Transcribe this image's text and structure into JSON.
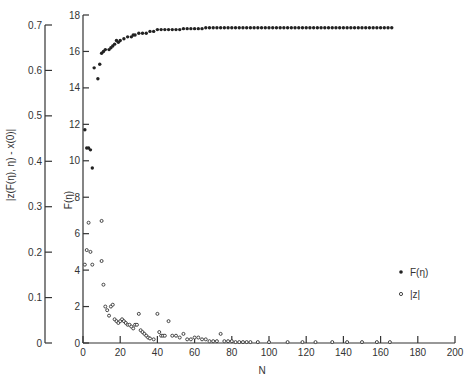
{
  "chart_data": {
    "type": "scatter",
    "title": "",
    "xlabel": "N",
    "ylabel": "F(η)",
    "ylabel_secondary": "|z(F(η), η) - x(0)|",
    "xlim": [
      0,
      200
    ],
    "ylim": [
      0,
      18
    ],
    "ylim_secondary": [
      0,
      0.7
    ],
    "grid": false,
    "legend_position": "right-middle",
    "x_ticks": [
      0,
      20,
      40,
      60,
      80,
      100,
      120,
      140,
      160,
      180,
      200
    ],
    "y_ticks": [
      0,
      2,
      4,
      6,
      8,
      10,
      12,
      14,
      16,
      18
    ],
    "y_ticks_secondary": [
      "0",
      "0.1",
      "0.2",
      "0.3",
      "0.4",
      "0.5",
      "0.6",
      "0.7"
    ],
    "legend": [
      {
        "label": "F(η)",
        "marker": "filled-dot"
      },
      {
        "label": "|z|",
        "marker": "open-circle"
      }
    ],
    "series": [
      {
        "name": "F(η)",
        "marker": "filled-dot",
        "axis": "primary",
        "x": [
          1,
          2,
          3,
          4,
          5,
          6,
          8,
          9,
          10,
          11,
          12,
          14,
          15,
          16,
          17,
          18,
          19,
          20,
          22,
          24,
          26,
          27,
          28,
          30,
          32,
          34,
          36,
          38,
          40,
          42,
          44,
          46,
          48,
          50,
          52,
          54,
          56,
          58,
          60,
          62,
          64,
          66,
          68,
          70,
          72,
          74,
          76,
          78,
          80,
          82,
          84,
          86,
          88,
          90,
          92,
          94,
          96,
          98,
          100,
          102,
          104,
          106,
          108,
          110,
          112,
          114,
          116,
          118,
          120,
          122,
          124,
          126,
          128,
          130,
          132,
          134,
          136,
          138,
          140,
          142,
          144,
          146,
          148,
          150,
          152,
          154,
          156,
          158,
          160,
          162,
          164,
          166
        ],
        "y": [
          11.7,
          10.7,
          10.7,
          10.6,
          9.6,
          15.1,
          14.5,
          15.3,
          15.9,
          16.0,
          16.1,
          16.1,
          16.2,
          16.3,
          16.4,
          16.6,
          16.5,
          16.6,
          16.7,
          16.8,
          16.8,
          16.9,
          16.9,
          17.0,
          17.0,
          17.0,
          17.1,
          17.1,
          17.2,
          17.2,
          17.2,
          17.2,
          17.2,
          17.2,
          17.2,
          17.25,
          17.25,
          17.25,
          17.25,
          17.25,
          17.25,
          17.3,
          17.3,
          17.3,
          17.3,
          17.3,
          17.3,
          17.3,
          17.3,
          17.3,
          17.3,
          17.3,
          17.3,
          17.3,
          17.3,
          17.3,
          17.3,
          17.3,
          17.3,
          17.3,
          17.3,
          17.3,
          17.3,
          17.3,
          17.3,
          17.3,
          17.3,
          17.3,
          17.3,
          17.3,
          17.3,
          17.3,
          17.3,
          17.3,
          17.3,
          17.3,
          17.3,
          17.3,
          17.3,
          17.3,
          17.3,
          17.3,
          17.3,
          17.3,
          17.3,
          17.3,
          17.3,
          17.3,
          17.3,
          17.3,
          17.3,
          17.3
        ]
      },
      {
        "name": "|z|",
        "marker": "open-circle",
        "axis": "primary_scale_shared",
        "x": [
          1,
          2,
          3,
          4,
          5,
          10,
          10,
          11,
          12,
          13,
          14,
          15,
          16,
          17,
          18,
          19,
          20,
          21,
          22,
          23,
          24,
          25,
          26,
          27,
          28,
          29,
          30,
          31,
          32,
          33,
          34,
          35,
          36,
          38,
          40,
          41,
          42,
          43,
          44,
          46,
          48,
          50,
          52,
          54,
          56,
          58,
          60,
          62,
          64,
          66,
          68,
          70,
          72,
          74,
          76,
          78,
          80,
          82,
          84,
          86,
          88,
          90,
          94,
          100,
          110,
          118,
          125,
          134,
          142,
          150,
          158,
          165
        ],
        "y": [
          4.3,
          5.1,
          6.6,
          5.0,
          4.3,
          6.7,
          4.5,
          3.2,
          2.0,
          1.8,
          1.5,
          2.0,
          2.1,
          1.3,
          1.2,
          1.1,
          1.2,
          1.3,
          1.2,
          1.1,
          1.0,
          1.0,
          0.9,
          0.8,
          1.0,
          1.0,
          1.6,
          0.7,
          0.6,
          0.5,
          0.4,
          0.3,
          0.25,
          0.2,
          1.6,
          0.6,
          0.4,
          0.4,
          0.4,
          1.2,
          0.4,
          0.4,
          0.3,
          0.5,
          0.2,
          0.2,
          0.3,
          0.3,
          0.2,
          0.2,
          0.1,
          0.1,
          0.1,
          0.5,
          0.1,
          0.1,
          0.1,
          0.05,
          0.05,
          0.05,
          0.05,
          0.05,
          0.05,
          0.05,
          0.05,
          0.05,
          0.05,
          0.05,
          0.05,
          0.05,
          0.05,
          0.05
        ]
      }
    ]
  }
}
